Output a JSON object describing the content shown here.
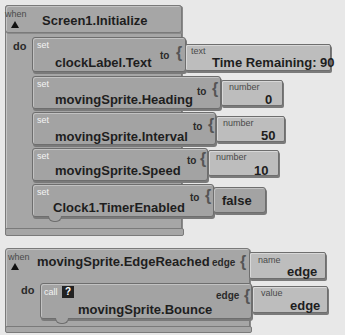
{
  "event1": {
    "when_label": "when",
    "do_label": "do",
    "event_name": "Screen1.Initialize",
    "statements": [
      {
        "set_label": "set",
        "property": "clockLabel.Text",
        "to_label": "to",
        "value_type": "text",
        "value": "Time Remaining: 90"
      },
      {
        "set_label": "set",
        "property": "movingSprite.Heading",
        "to_label": "to",
        "value_type": "number",
        "value": "0"
      },
      {
        "set_label": "set",
        "property": "movingSprite.Interval",
        "to_label": "to",
        "value_type": "number",
        "value": "50"
      },
      {
        "set_label": "set",
        "property": "movingSprite.Speed",
        "to_label": "to",
        "value_type": "number",
        "value": "10"
      },
      {
        "set_label": "set",
        "property": "Clock1.TimerEnabled",
        "to_label": "to",
        "value_type": "",
        "value": "false"
      }
    ]
  },
  "event2": {
    "when_label": "when",
    "do_label": "do",
    "event_name": "movingSprite.EdgeReached",
    "param_label": "edge",
    "param_type": "name",
    "param_value": "edge",
    "call": {
      "call_label": "call",
      "help_icon": "?",
      "method": "movingSprite.Bounce",
      "arg_label": "edge",
      "arg_type": "value",
      "arg_value": "edge"
    }
  }
}
